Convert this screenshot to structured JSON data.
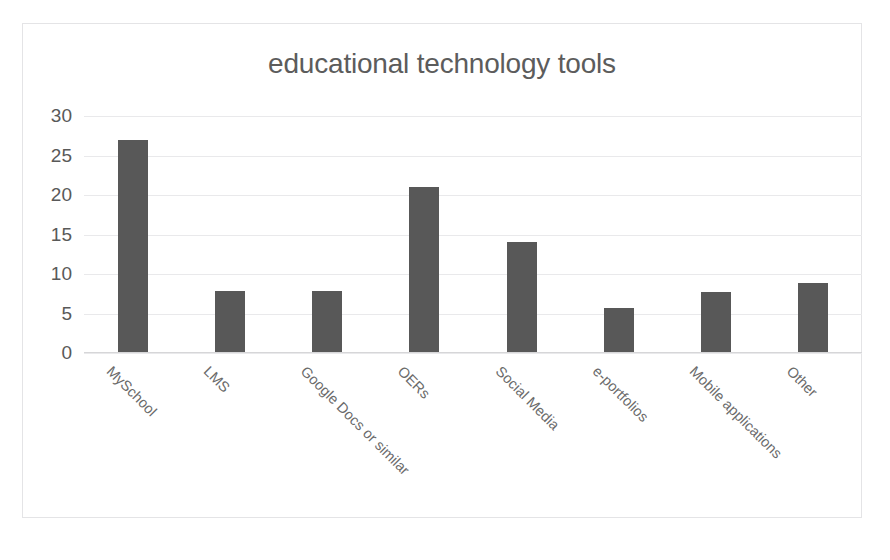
{
  "chart_data": {
    "type": "bar",
    "title": "educational technology tools",
    "xlabel": "",
    "ylabel": "",
    "categories": [
      "MySchool",
      "LMS",
      "Google Docs or similar",
      "OERs",
      "Social Media",
      "e-portfolios",
      "Mobile applications",
      "Other"
    ],
    "values": [
      27,
      7.8,
      7.8,
      21,
      14,
      5.7,
      7.7,
      8.8
    ],
    "ylim": [
      0,
      30
    ],
    "yticks": [
      0,
      5,
      10,
      15,
      20,
      25,
      30
    ],
    "ytick_labels": [
      "0",
      "5",
      "10",
      "15",
      "20",
      "25",
      "30"
    ],
    "grid": true,
    "legend": false,
    "bar_color": "#585858",
    "gridline_color": "#e9e9eb",
    "title_color": "#5c5c5c",
    "tick_label_color": "#595959",
    "category_label_color": "#6a6a6a",
    "frame_border_color": "#e4e4e6",
    "background_color": "#ffffff"
  }
}
